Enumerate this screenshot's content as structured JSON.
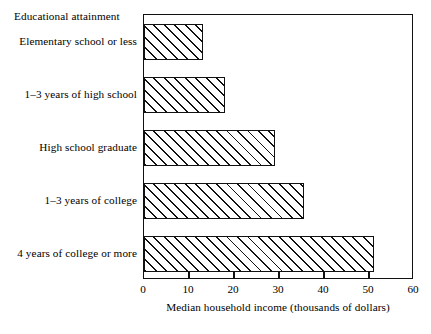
{
  "chart_data": {
    "type": "bar",
    "orientation": "horizontal",
    "title": "",
    "series_title": "Educational attainment",
    "categories": [
      "Elementary school or less",
      "1–3 years of high school",
      "High school graduate",
      "1–3 years of college",
      "4 years of college or more"
    ],
    "values": [
      13,
      18,
      29,
      35.5,
      51
    ],
    "xlabel": "Median household income (thousands of dollars)",
    "ylabel": "Educational attainment",
    "xlim": [
      0,
      60
    ],
    "xticks": [
      0,
      10,
      20,
      30,
      40,
      50,
      60
    ],
    "xtick_labels": [
      "0",
      "10",
      "20",
      "30",
      "40",
      "50",
      "60"
    ],
    "grid": false,
    "legend": null,
    "bar_fill": "diagonal-hatch",
    "colors": {
      "line": "#111111",
      "fill": "#ffffff",
      "hatch": "#111111",
      "background": "#ffffff"
    }
  }
}
